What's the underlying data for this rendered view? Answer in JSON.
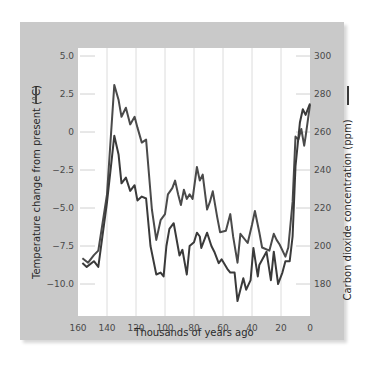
{
  "chart_data": {
    "type": "line",
    "title": "",
    "xlabel": "Thousands of years ago",
    "ylabel_left": "Temperature change from present (°C)",
    "ylabel_right": "Carbon dioxide concentration (ppm)",
    "xlim": [
      160,
      0
    ],
    "ylim_left": [
      -12.0,
      5.0
    ],
    "ylim_right": [
      176,
      300
    ],
    "x_ticks": [
      160,
      140,
      120,
      100,
      80,
      60,
      40,
      20,
      0
    ],
    "x_tick_labels": [
      "160",
      "140",
      "120",
      "100",
      "80",
      "60",
      "40",
      "20",
      "0"
    ],
    "y_left_ticks": [
      5.0,
      2.5,
      0,
      -2.5,
      -5.0,
      -7.5,
      -10.0
    ],
    "y_left_tick_labels": [
      "5.0",
      "2.5",
      "0",
      "−2.5",
      "−5.0",
      "−7.5",
      "−10.0"
    ],
    "y_right_ticks": [
      300,
      280,
      260,
      240,
      220,
      200,
      180
    ],
    "y_right_tick_labels": [
      "300",
      "280",
      "260",
      "240",
      "220",
      "200",
      "180"
    ],
    "grid": "vertical",
    "legend": "line marks beside each y-axis label",
    "series": [
      {
        "name": "Temperature change",
        "axis": "left",
        "color": "#4a4a4a",
        "x": [
          157,
          153,
          149,
          146,
          140,
          135,
          132,
          130,
          127,
          124,
          121,
          119,
          116,
          113,
          109,
          106,
          103,
          100,
          98,
          95,
          93,
          91,
          89,
          87,
          85,
          83,
          81,
          78,
          76,
          74,
          71,
          69,
          67,
          64,
          62,
          58,
          55,
          53,
          50,
          48,
          43,
          40,
          38,
          35,
          33,
          28,
          25,
          23,
          21,
          17,
          15,
          12,
          10,
          8,
          6,
          4,
          3,
          0
        ],
        "values": [
          -8.3,
          -8.6,
          -8.1,
          -7.8,
          -4.1,
          3.1,
          2.1,
          1.0,
          1.6,
          0.5,
          1.0,
          0.3,
          -0.7,
          -0.5,
          -5.1,
          -7.1,
          -5.8,
          -5.4,
          -4.1,
          -3.7,
          -3.2,
          -4.1,
          -4.8,
          -3.8,
          -4.4,
          -4.1,
          -4.4,
          -2.3,
          -3.2,
          -2.8,
          -5.1,
          -4.6,
          -3.9,
          -5.6,
          -6.6,
          -6.5,
          -5.4,
          -6.9,
          -8.6,
          -6.7,
          -7.3,
          -6.1,
          -5.2,
          -6.6,
          -7.6,
          -7.8,
          -6.7,
          -7.1,
          -7.4,
          -8.2,
          -7.6,
          -4.6,
          -0.3,
          -0.5,
          0.2,
          -0.9,
          -0.3,
          1.8
        ]
      },
      {
        "name": "CO2 concentration",
        "axis": "right",
        "color": "#3a3a3a",
        "x": [
          157,
          154,
          149,
          146,
          140,
          135,
          132,
          130,
          127,
          124,
          121,
          119,
          116,
          113,
          110,
          106,
          103,
          101,
          99,
          97,
          94,
          90,
          88,
          85,
          83,
          80,
          78,
          76,
          75,
          71,
          68,
          66,
          63,
          61,
          57,
          55,
          52,
          50,
          46,
          44,
          41,
          39,
          36,
          35,
          30,
          27,
          25,
          22,
          19,
          17,
          14,
          12,
          10,
          7,
          5,
          3,
          0
        ],
        "values": [
          191,
          189,
          192,
          189,
          223,
          258,
          248,
          233,
          236,
          229,
          232,
          224,
          226,
          225,
          200,
          185,
          186,
          184,
          200,
          209,
          212,
          195,
          198,
          185,
          200,
          202,
          207,
          205,
          199,
          207,
          200,
          197,
          191,
          193,
          188,
          186,
          186,
          171,
          183,
          177,
          182,
          199,
          184,
          190,
          197,
          182,
          197,
          180,
          186,
          192,
          192,
          205,
          242,
          265,
          272,
          269,
          275
        ]
      }
    ]
  }
}
